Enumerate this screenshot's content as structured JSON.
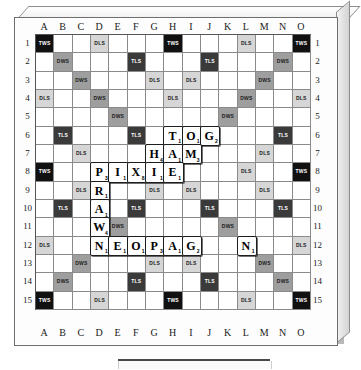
{
  "board": {
    "name": "Scrabble board",
    "size": 15,
    "column_headers": [
      "A",
      "B",
      "C",
      "D",
      "E",
      "F",
      "G",
      "H",
      "I",
      "J",
      "K",
      "L",
      "M",
      "N",
      "O"
    ],
    "row_numbers": [
      "1",
      "2",
      "3",
      "4",
      "5",
      "6",
      "7",
      "8",
      "9",
      "10",
      "11",
      "12",
      "13",
      "14",
      "15"
    ],
    "premium_labels": {
      "tws": "TWS",
      "tls": "TLS",
      "dws": "DWS",
      "dls": "DLS"
    },
    "premium_colors": {
      "tws": "#111111",
      "tls": "#3a3a3a",
      "dws": "#9e9e9e",
      "dls": "#d6d6d6",
      "empty": "#ffffff"
    },
    "premium_map": [
      [
        "tws",
        "",
        "",
        "dls",
        "",
        "",
        "",
        "tws",
        "",
        "",
        "",
        "dls",
        "",
        "",
        "tws"
      ],
      [
        "",
        "dws",
        "",
        "",
        "",
        "tls",
        "",
        "",
        "",
        "tls",
        "",
        "",
        "",
        "dws",
        ""
      ],
      [
        "",
        "",
        "dws",
        "",
        "",
        "",
        "dls",
        "",
        "dls",
        "",
        "",
        "",
        "dws",
        "",
        ""
      ],
      [
        "dls",
        "",
        "",
        "dws",
        "",
        "",
        "",
        "dls",
        "",
        "",
        "",
        "dws",
        "",
        "",
        "dls"
      ],
      [
        "",
        "",
        "",
        "",
        "dws",
        "",
        "",
        "",
        "",
        "",
        "dws",
        "",
        "",
        "",
        ""
      ],
      [
        "",
        "tls",
        "",
        "",
        "",
        "tls",
        "",
        "",
        "",
        "tls",
        "",
        "",
        "",
        "tls",
        ""
      ],
      [
        "",
        "",
        "dls",
        "",
        "",
        "",
        "dls",
        "",
        "dls",
        "",
        "",
        "",
        "dls",
        "",
        ""
      ],
      [
        "tws",
        "",
        "",
        "dls",
        "",
        "",
        "",
        "star",
        "",
        "",
        "",
        "dls",
        "",
        "",
        "tws"
      ],
      [
        "",
        "",
        "dls",
        "",
        "",
        "",
        "dls",
        "",
        "dls",
        "",
        "",
        "",
        "dls",
        "",
        ""
      ],
      [
        "",
        "tls",
        "",
        "",
        "",
        "tls",
        "",
        "",
        "",
        "tls",
        "",
        "",
        "",
        "tls",
        ""
      ],
      [
        "",
        "",
        "",
        "",
        "dws",
        "",
        "",
        "",
        "",
        "",
        "dws",
        "",
        "",
        "",
        ""
      ],
      [
        "dls",
        "",
        "",
        "dws",
        "",
        "",
        "",
        "dls",
        "",
        "",
        "",
        "dws",
        "",
        "",
        "dls"
      ],
      [
        "",
        "",
        "dws",
        "",
        "",
        "",
        "dls",
        "",
        "dls",
        "",
        "",
        "",
        "dws",
        "",
        ""
      ],
      [
        "",
        "dws",
        "",
        "",
        "",
        "tls",
        "",
        "",
        "",
        "tls",
        "",
        "",
        "",
        "dws",
        ""
      ],
      [
        "tws",
        "",
        "",
        "dls",
        "",
        "",
        "",
        "tws",
        "",
        "",
        "",
        "dls",
        "",
        "",
        "tws"
      ]
    ],
    "tiles": [
      {
        "row": 6,
        "col": "H",
        "col_index": 7,
        "letter": "T",
        "value": "1"
      },
      {
        "row": 6,
        "col": "I",
        "col_index": 8,
        "letter": "O",
        "value": "1"
      },
      {
        "row": 6,
        "col": "J",
        "col_index": 9,
        "letter": "G",
        "value": "2"
      },
      {
        "row": 7,
        "col": "G",
        "col_index": 6,
        "letter": "H",
        "value": "4"
      },
      {
        "row": 7,
        "col": "H",
        "col_index": 7,
        "letter": "A",
        "value": "1"
      },
      {
        "row": 7,
        "col": "I",
        "col_index": 8,
        "letter": "M",
        "value": "3"
      },
      {
        "row": 8,
        "col": "D",
        "col_index": 3,
        "letter": "P",
        "value": "3"
      },
      {
        "row": 8,
        "col": "E",
        "col_index": 4,
        "letter": "I",
        "value": "1"
      },
      {
        "row": 8,
        "col": "F",
        "col_index": 5,
        "letter": "X",
        "value": "8"
      },
      {
        "row": 8,
        "col": "G",
        "col_index": 6,
        "letter": "I",
        "value": "1"
      },
      {
        "row": 8,
        "col": "H",
        "col_index": 7,
        "letter": "E",
        "value": "1"
      },
      {
        "row": 9,
        "col": "D",
        "col_index": 3,
        "letter": "R",
        "value": "1"
      },
      {
        "row": 10,
        "col": "D",
        "col_index": 3,
        "letter": "A",
        "value": "1"
      },
      {
        "row": 11,
        "col": "D",
        "col_index": 3,
        "letter": "W",
        "value": "4"
      },
      {
        "row": 12,
        "col": "D",
        "col_index": 3,
        "letter": "N",
        "value": "1"
      },
      {
        "row": 12,
        "col": "E",
        "col_index": 4,
        "letter": "E",
        "value": "1"
      },
      {
        "row": 12,
        "col": "F",
        "col_index": 5,
        "letter": "O",
        "value": "1"
      },
      {
        "row": 12,
        "col": "G",
        "col_index": 6,
        "letter": "P",
        "value": "3"
      },
      {
        "row": 12,
        "col": "H",
        "col_index": 7,
        "letter": "A",
        "value": "1"
      },
      {
        "row": 12,
        "col": "I",
        "col_index": 8,
        "letter": "G",
        "value": "2"
      },
      {
        "row": 12,
        "col": "L",
        "col_index": 11,
        "letter": "N",
        "value": "1"
      }
    ],
    "words_on_board": [
      "TOG",
      "HAM",
      "PIXIE",
      "PRAWN",
      "NEOPAG"
    ]
  },
  "rack": {
    "name": "tile rack",
    "tiles": []
  }
}
